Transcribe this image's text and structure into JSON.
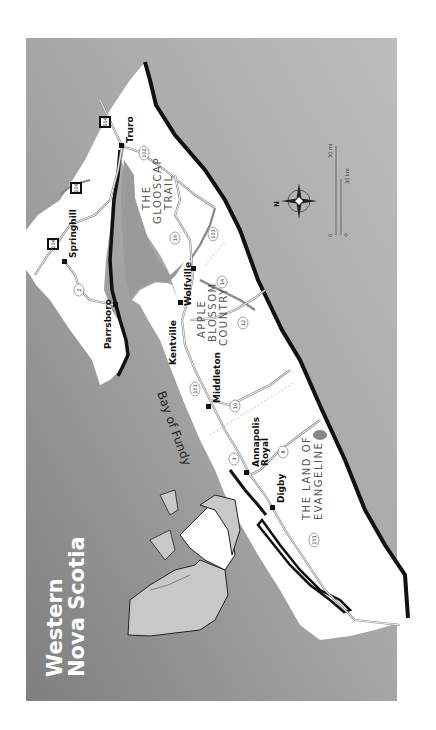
{
  "title": {
    "line1": "Western",
    "line2": "Nova Scotia"
  },
  "water": {
    "bay_label": "Bay of Fundy"
  },
  "regions": [
    {
      "name": "glooscap-trail",
      "lines": [
        "THE",
        "GLOOSCAP",
        "TRAIL"
      ]
    },
    {
      "name": "apple-blossom-country",
      "lines": [
        "APPLE",
        "BLOSSOM",
        "COUNTRY"
      ]
    },
    {
      "name": "land-of-evangeline",
      "lines": [
        "THE LAND OF",
        "EVANGELINE"
      ]
    }
  ],
  "towns": [
    {
      "name": "Truro"
    },
    {
      "name": "Springhill"
    },
    {
      "name": "Parrsboro"
    },
    {
      "name": "Wolfville"
    },
    {
      "name": "Kentville"
    },
    {
      "name": "Middleton"
    },
    {
      "name": "Annapolis Royal",
      "lines": [
        "Annapolis",
        "Royal"
      ]
    },
    {
      "name": "Digby"
    }
  ],
  "highways": {
    "trans_canada": [
      "104",
      "104",
      "104"
    ],
    "routes": [
      "102",
      "14",
      "101",
      "2",
      "14",
      "12",
      "101",
      "10",
      "1",
      "8",
      "101"
    ]
  },
  "compass": {
    "north_label": "N"
  },
  "scale": {
    "zero": "0",
    "miles": "30 mi",
    "km": "30 km"
  },
  "colors": {
    "water_dark": "#8c8c8c",
    "water_light": "#b8b8b8",
    "land": "#ffffff",
    "coast": "#111111",
    "inset_land": "#c8c8c8"
  }
}
